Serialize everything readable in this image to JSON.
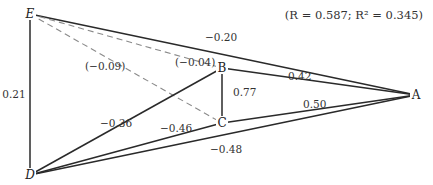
{
  "stats": "(R = 0.587; R² = 0.345)",
  "nodes": [
    {
      "id": "E",
      "label": "E"
    },
    {
      "id": "B",
      "label": "B"
    },
    {
      "id": "C",
      "label": "C"
    },
    {
      "id": "A",
      "label": "A"
    },
    {
      "id": "D",
      "label": "D"
    }
  ],
  "edges": [
    {
      "from": "E",
      "to": "A",
      "label": "−0.20",
      "style": "solid"
    },
    {
      "from": "E",
      "to": "B",
      "label": "(−0.04)",
      "style": "dashed"
    },
    {
      "from": "E",
      "to": "C",
      "label": "(−0.09)",
      "style": "dashed"
    },
    {
      "from": "E",
      "to": "D",
      "label": "0.21",
      "style": "solid"
    },
    {
      "from": "B",
      "to": "A",
      "label": "0.42",
      "style": "solid"
    },
    {
      "from": "B",
      "to": "C",
      "label": "0.77",
      "style": "solid"
    },
    {
      "from": "C",
      "to": "A",
      "label": "0.50",
      "style": "solid"
    },
    {
      "from": "D",
      "to": "B",
      "label": "−0.36",
      "style": "solid"
    },
    {
      "from": "D",
      "to": "C",
      "label": "−0.46",
      "style": "solid"
    },
    {
      "from": "D",
      "to": "A",
      "label": "−0.48",
      "style": "solid"
    }
  ]
}
